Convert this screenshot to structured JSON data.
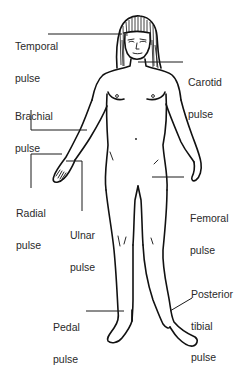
{
  "figure": {
    "labels": [
      {
        "id": "temporal",
        "line1": "Temporal",
        "line2": "pulse"
      },
      {
        "id": "carotid",
        "line1": "Carotid",
        "line2": "pulse"
      },
      {
        "id": "brachial",
        "line1": "Brachial",
        "line2": "pulse"
      },
      {
        "id": "radial",
        "line1": "Radial",
        "line2": "pulse"
      },
      {
        "id": "ulnar",
        "line1": "Ulnar",
        "line2": "pulse"
      },
      {
        "id": "femoral",
        "line1": "Femoral",
        "line2": "pulse"
      },
      {
        "id": "posterior_tibial",
        "line1": "Posterior",
        "line2": "tibial",
        "line3": "pulse"
      },
      {
        "id": "pedal",
        "line1": "Pedal",
        "line2": "pulse"
      }
    ]
  },
  "colors": {
    "line": "#111111",
    "text": "#2a2a2a",
    "background": "#ffffff"
  }
}
